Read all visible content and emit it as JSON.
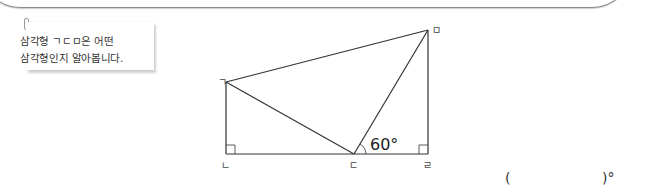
{
  "note": {
    "line1": "삼각형 ㄱㄷㅁ은 어떤",
    "line2": "삼각형인지 알아봅니다."
  },
  "figure": {
    "vertices": {
      "giyeok": "ㄱ",
      "nieun": "ㄴ",
      "digeut": "ㄷ",
      "rieul": "ㄹ",
      "mieum": "ㅁ"
    },
    "angle_label": "60°"
  },
  "answer": {
    "open": "(",
    "close": ")°"
  }
}
